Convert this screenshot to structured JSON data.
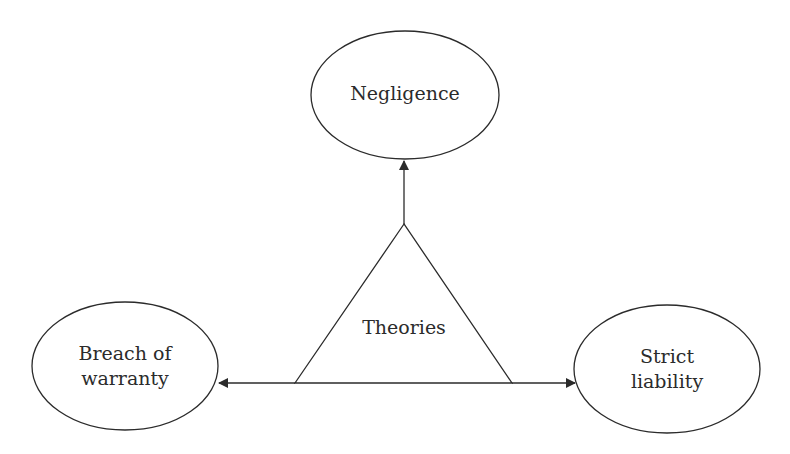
{
  "diagram": {
    "center": {
      "label": "Theories",
      "shape": "triangle"
    },
    "nodes": [
      {
        "id": "negligence",
        "lines": [
          "Negligence"
        ],
        "shape": "ellipse",
        "position": "top"
      },
      {
        "id": "breach",
        "lines": [
          "Breach of",
          "warranty"
        ],
        "shape": "ellipse",
        "position": "left"
      },
      {
        "id": "strict",
        "lines": [
          "Strict",
          "liability"
        ],
        "shape": "ellipse",
        "position": "right"
      }
    ],
    "edges": [
      {
        "from": "Theories",
        "to": "Negligence",
        "arrow": "up"
      },
      {
        "from": "Theories",
        "to": "Breach of warranty",
        "arrow": "left"
      },
      {
        "from": "Theories",
        "to": "Strict liability",
        "arrow": "right"
      }
    ],
    "stroke_color": "#2b2b2b"
  }
}
